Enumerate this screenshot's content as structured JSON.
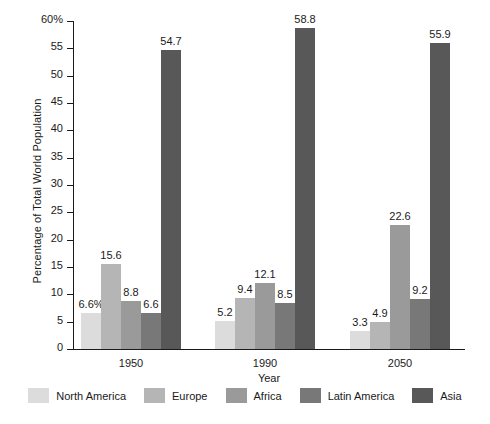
{
  "chart_data": {
    "type": "bar",
    "title": "",
    "xlabel": "Year",
    "ylabel": "Percentage of Total World Population",
    "categories": [
      "1950",
      "1990",
      "2050"
    ],
    "ylim": [
      0,
      60
    ],
    "ytick_values": [
      0,
      5,
      10,
      15,
      20,
      25,
      30,
      35,
      40,
      45,
      50,
      55,
      60
    ],
    "ytick_labels": [
      "0",
      "5",
      "10",
      "15",
      "20",
      "25",
      "30",
      "35",
      "40",
      "45",
      "50",
      "55",
      "60%"
    ],
    "grid": false,
    "legend_position": "bottom",
    "series": [
      {
        "name": "North America",
        "color": "#dcdcdc",
        "values": [
          6.6,
          5.2,
          3.3
        ],
        "labels": [
          "6.6%",
          "5.2",
          "3.3"
        ]
      },
      {
        "name": "Europe",
        "color": "#b5b5b5",
        "values": [
          15.6,
          9.4,
          4.9
        ],
        "labels": [
          "15.6",
          "9.4",
          "4.9"
        ]
      },
      {
        "name": "Africa",
        "color": "#9a9a9a",
        "values": [
          8.8,
          12.1,
          22.6
        ],
        "labels": [
          "8.8",
          "12.1",
          "22.6"
        ]
      },
      {
        "name": "Latin America",
        "color": "#787878",
        "values": [
          6.6,
          8.5,
          9.2
        ],
        "labels": [
          "6.6",
          "8.5",
          "9.2"
        ]
      },
      {
        "name": "Asia",
        "color": "#585858",
        "values": [
          54.7,
          58.8,
          55.9
        ],
        "labels": [
          "54.7",
          "58.8",
          "55.9"
        ]
      }
    ]
  },
  "axis": {
    "y_title": "Percentage of Total World Population",
    "x_title": "Year"
  },
  "legend": {
    "items": [
      {
        "label": "North America",
        "color": "#dcdcdc"
      },
      {
        "label": "Europe",
        "color": "#b5b5b5"
      },
      {
        "label": "Africa",
        "color": "#9a9a9a"
      },
      {
        "label": "Latin America",
        "color": "#787878"
      },
      {
        "label": "Asia",
        "color": "#585858"
      }
    ]
  }
}
